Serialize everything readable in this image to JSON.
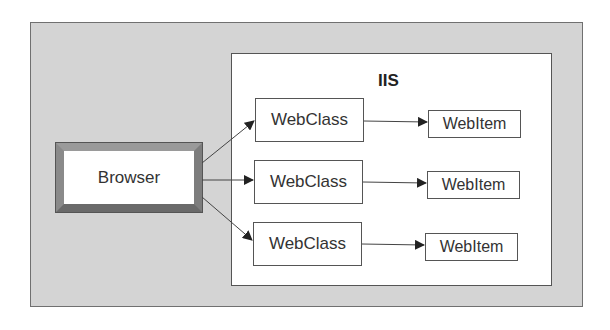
{
  "diagram": {
    "container_label": "IIS",
    "client": {
      "label": "Browser"
    },
    "webclasses": [
      {
        "label": "WebClass"
      },
      {
        "label": "WebClass"
      },
      {
        "label": "WebClass"
      }
    ],
    "webitems": [
      {
        "label": "WebItem"
      },
      {
        "label": "WebItem"
      },
      {
        "label": "WebItem"
      }
    ],
    "edges": [
      {
        "from": "Browser",
        "to": "WebClass 1"
      },
      {
        "from": "Browser",
        "to": "WebClass 2"
      },
      {
        "from": "Browser",
        "to": "WebClass 3"
      },
      {
        "from": "WebClass 1",
        "to": "WebItem 1"
      },
      {
        "from": "WebClass 2",
        "to": "WebItem 2"
      },
      {
        "from": "WebClass 3",
        "to": "WebItem 3"
      }
    ],
    "colors": {
      "background_panel": "#d4d4d4",
      "container": "#ffffff",
      "stroke": "#555555"
    }
  }
}
